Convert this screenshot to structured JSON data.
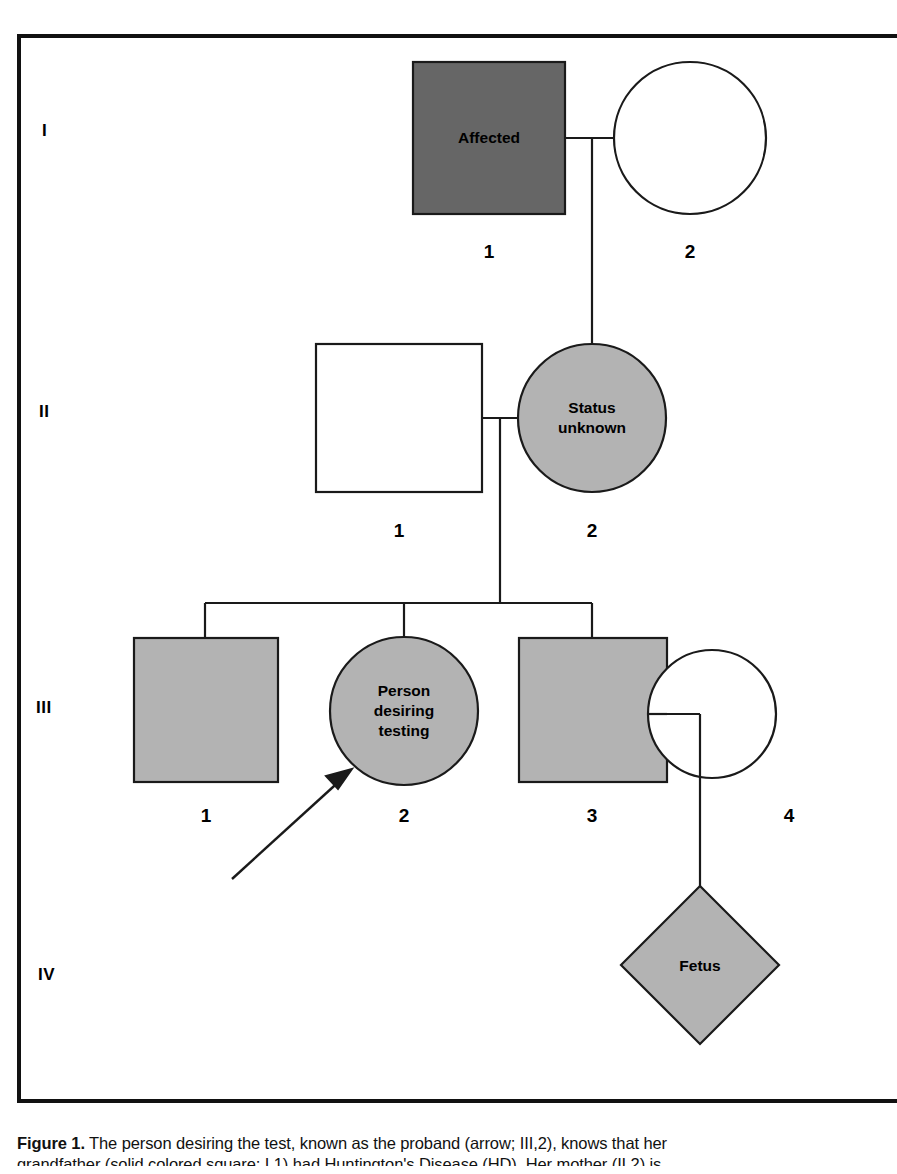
{
  "figure": {
    "frame_color": "#111111",
    "background": "#ffffff",
    "fill_affected": "#666666",
    "fill_gray": "#b3b3b3",
    "fill_unaffected": "#ffffff",
    "stroke": "#1a1a1a"
  },
  "generations": [
    {
      "id": "gen-1",
      "label": "I",
      "x": 42,
      "y": 130
    },
    {
      "id": "gen-2",
      "label": "II",
      "x": 39,
      "y": 411
    },
    {
      "id": "gen-3",
      "label": "III",
      "x": 36,
      "y": 707
    },
    {
      "id": "gen-4",
      "label": "IV",
      "x": 38,
      "y": 974
    }
  ],
  "individuals": [
    {
      "id": "I-1",
      "generation": "I",
      "number": "1",
      "sex": "male",
      "shape": "square",
      "status": "affected",
      "fill": "#666666",
      "label": "Affected",
      "cx": 489,
      "cy": 138,
      "number_x": 489,
      "number_y": 241
    },
    {
      "id": "I-2",
      "generation": "I",
      "number": "2",
      "sex": "female",
      "shape": "circle",
      "status": "unaffected",
      "fill": "#ffffff",
      "label": "",
      "cx": 690,
      "cy": 138,
      "number_x": 690,
      "number_y": 241
    },
    {
      "id": "II-1",
      "generation": "II",
      "number": "1",
      "sex": "male",
      "shape": "square",
      "status": "unaffected",
      "fill": "#ffffff",
      "label": "",
      "cx": 399,
      "cy": 418,
      "number_x": 399,
      "number_y": 520
    },
    {
      "id": "II-2",
      "generation": "II",
      "number": "2",
      "sex": "female",
      "shape": "circle",
      "status": "at-risk",
      "fill": "#b3b3b3",
      "label": "Status\nunknown",
      "cx": 592,
      "cy": 418,
      "number_x": 592,
      "number_y": 520
    },
    {
      "id": "III-1",
      "generation": "III",
      "number": "1",
      "sex": "male",
      "shape": "square",
      "status": "at-risk",
      "fill": "#b3b3b3",
      "label": "",
      "cx": 206,
      "cy": 710,
      "number_x": 206,
      "number_y": 808
    },
    {
      "id": "III-2",
      "generation": "III",
      "number": "2",
      "sex": "female",
      "shape": "circle",
      "status": "at-risk",
      "fill": "#b3b3b3",
      "label": "Person\ndesiring\ntesting",
      "cx": 404,
      "cy": 710,
      "number_x": 404,
      "number_y": 808
    },
    {
      "id": "III-3",
      "generation": "III",
      "number": "3",
      "sex": "male",
      "shape": "square",
      "status": "at-risk",
      "fill": "#b3b3b3",
      "label": "",
      "cx": 592,
      "cy": 710,
      "number_x": 592,
      "number_y": 808
    },
    {
      "id": "III-4",
      "generation": "III",
      "number": "4",
      "sex": "female",
      "shape": "circle",
      "status": "unaffected",
      "fill": "#ffffff",
      "label": "",
      "cx": 712,
      "cy": 714,
      "number_x": 712,
      "number_y": 808
    },
    {
      "id": "IV-1",
      "generation": "IV",
      "number": "",
      "sex": "unknown",
      "shape": "diamond",
      "status": "at-risk",
      "fill": "#b3b3b3",
      "label": "Fetus",
      "cx": 700,
      "cy": 965,
      "number_x": 700,
      "number_y": 1065
    }
  ],
  "proband_arrow": {
    "name": "proband-arrow",
    "points_to": "III-2",
    "from_x": 232,
    "from_y": 879,
    "to_x": 350,
    "to_y": 772
  },
  "caption": {
    "lead": "Figure 1.",
    "line1": " The person desiring the test, known as the proband (arrow; III,2), knows that her",
    "line2": "grandfather (solid colored square; I,1) had Huntington's Disease (HD). Her mother (II,2) is"
  }
}
